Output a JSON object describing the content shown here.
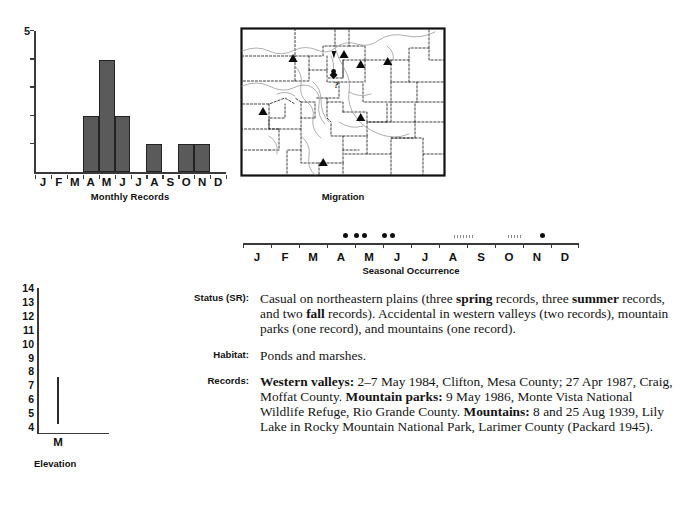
{
  "monthly_chart": {
    "caption": "Monthly Records",
    "y_max_label": "5"
  },
  "map": {
    "caption": "Migration"
  },
  "seasonal": {
    "caption": "Seasonal Occurrence"
  },
  "elevation": {
    "caption": "Elevation",
    "category_label": "M"
  },
  "entries": [
    {
      "label": "Status (SR):",
      "html": "Casual on northeastern plains (three <b>spring</b> records, three <b>summer</b> records, and two <b>fall</b> records). Accidental in western valleys (two records), mountain parks (one record), and mountains (one record)."
    },
    {
      "label": "Habitat:",
      "html": "Ponds and marshes."
    },
    {
      "label": "Records:",
      "html": "<b>Western valleys:</b> 2&#8211;7 May 1984, Clifton, Mesa County; 27 Apr 1987, Craig, Moffat County. <b>Mountain parks:</b> 9 May 1986, Monte Vista National Wildlife Refuge, Rio Grande County. <b>Mountains:</b> 8 and 25 Aug 1939, Lily Lake in Rocky Mountain National Park, Larimer County (Packard 1945)."
    }
  ],
  "chart_data": [
    {
      "type": "bar",
      "title": "Monthly Records",
      "xlabel": "Monthly Records",
      "ylabel": "",
      "categories": [
        "J",
        "F",
        "M",
        "A",
        "M",
        "J",
        "J",
        "A",
        "S",
        "O",
        "N",
        "D"
      ],
      "values": [
        0,
        0,
        0,
        2,
        4,
        2,
        0,
        1,
        0,
        1,
        1,
        0
      ],
      "ylim": [
        0,
        5
      ],
      "yticks": [
        0,
        1,
        2,
        3,
        4,
        5
      ],
      "ytick_labels": [
        "",
        "",
        "",
        "",
        "",
        "5"
      ],
      "grid": false,
      "legend": "none",
      "bar_color": "#5a5a5a",
      "bar_edge_color": "#232323"
    },
    {
      "type": "line",
      "title": "Elevation",
      "xlabel": "Elevation",
      "ylabel": "",
      "categories": [
        "M"
      ],
      "ylim": [
        3.5,
        14
      ],
      "yticks": [
        4,
        5,
        6,
        7,
        8,
        9,
        10,
        11,
        12,
        13,
        14
      ],
      "ytick_labels": [
        "4",
        "5",
        "6",
        "7",
        "8",
        "9",
        "10",
        "11",
        "12",
        "13",
        "14"
      ],
      "series": [
        {
          "name": "M",
          "range_low": 4.2,
          "range_high": 7.6
        }
      ],
      "grid": false,
      "legend": "none"
    },
    {
      "type": "scatter",
      "title": "Seasonal Occurrence",
      "xlabel": "Seasonal Occurrence",
      "categories": [
        "J",
        "F",
        "M",
        "A",
        "M",
        "J",
        "J",
        "A",
        "S",
        "O",
        "N",
        "D"
      ],
      "point_months": [
        4.15,
        4.55,
        4.85,
        5.55,
        5.85,
        11.2
      ],
      "hatch_spans": [
        {
          "start": 8.05,
          "end": 8.75
        },
        {
          "start": 9.95,
          "end": 10.45
        }
      ],
      "grid": false,
      "legend": "none"
    }
  ],
  "map_data": {
    "type": "map",
    "region": "Colorado",
    "caption": "Migration",
    "markers": [
      {
        "symbol": "triangle-up",
        "x": 0.26,
        "y": 0.21
      },
      {
        "symbol": "triangle-down",
        "x": 0.445,
        "y": 0.185
      },
      {
        "symbol": "triangle-up",
        "x": 0.505,
        "y": 0.175
      },
      {
        "symbol": "triangle-up",
        "x": 0.585,
        "y": 0.245
      },
      {
        "symbol": "triangle-up",
        "x": 0.715,
        "y": 0.225
      },
      {
        "symbol": "diamond",
        "x": 0.455,
        "y": 0.325
      },
      {
        "symbol": "question",
        "x": 0.475,
        "y": 0.4
      },
      {
        "symbol": "triangle-up",
        "x": 0.115,
        "y": 0.56
      },
      {
        "symbol": "triangle-up",
        "x": 0.585,
        "y": 0.6
      },
      {
        "symbol": "triangle-up",
        "x": 0.405,
        "y": 0.895
      }
    ]
  }
}
